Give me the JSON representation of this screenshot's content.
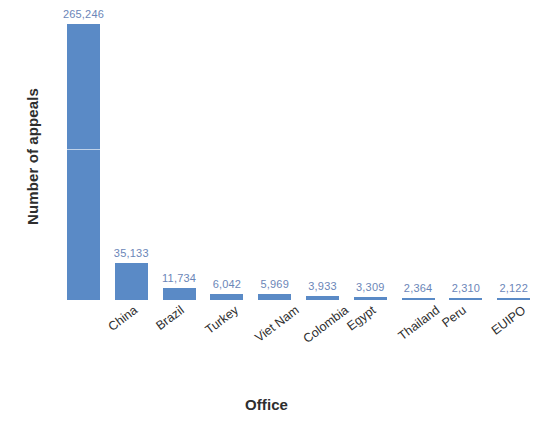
{
  "chart_data": {
    "type": "bar",
    "title": "",
    "subtitle": "",
    "xlabel": "Office",
    "ylabel": "Number of appeals",
    "categories": [
      "China",
      "Brazil",
      "Turkey",
      "Viet Nam",
      "Colombia",
      "Egypt",
      "Thailand",
      "Peru",
      "EUIPO",
      "Sri Lanka"
    ],
    "values": [
      265246,
      35133,
      11734,
      6042,
      5969,
      3933,
      3309,
      2364,
      2310,
      2122
    ],
    "value_labels": [
      "265,246",
      "35,133",
      "11,734",
      "6,042",
      "5,969",
      "3,933",
      "3,309",
      "2,364",
      "2,310",
      "2,122"
    ],
    "ylim": [
      0,
      265246
    ],
    "grid": false,
    "legend": "none",
    "axis_ticks_visible": false,
    "bar_color": "#5a8ac6",
    "value_label_color": "#6b86b8",
    "axis_title_color": "#2e2e2e",
    "category_label_color": "#2f2f2f",
    "background_color": "#ffffff"
  },
  "axes": {
    "y_title": "Number of appeals",
    "x_title": "Office"
  }
}
